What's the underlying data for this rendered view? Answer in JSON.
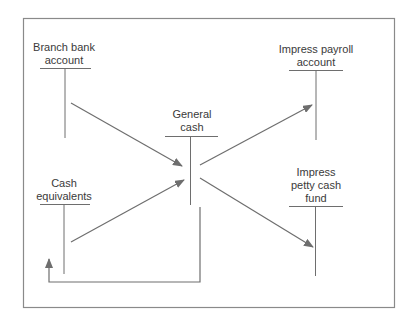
{
  "diagram": {
    "title": "",
    "colors": {
      "line": "#6e6e6e",
      "frame": "#8a8a8a",
      "text": "#3a3a3a"
    },
    "accounts": [
      {
        "id": "branch-bank-account",
        "label_lines": [
          "Branch bank",
          "account"
        ]
      },
      {
        "id": "general-cash",
        "label_lines": [
          "General",
          "cash"
        ]
      },
      {
        "id": "impress-payroll-account",
        "label_lines": [
          "Impress payroll",
          "account"
        ]
      },
      {
        "id": "cash-equivalents",
        "label_lines": [
          "Cash",
          "equivalents"
        ]
      },
      {
        "id": "impress-petty-cash-fund",
        "label_lines": [
          "Impress",
          "petty cash",
          "fund"
        ]
      }
    ],
    "flows": [
      {
        "from": "branch-bank-account",
        "to": "general-cash"
      },
      {
        "from": "cash-equivalents",
        "to": "general-cash"
      },
      {
        "from": "general-cash",
        "to": "impress-payroll-account"
      },
      {
        "from": "general-cash",
        "to": "impress-petty-cash-fund"
      },
      {
        "from": "general-cash",
        "to": "cash-equivalents"
      }
    ]
  }
}
